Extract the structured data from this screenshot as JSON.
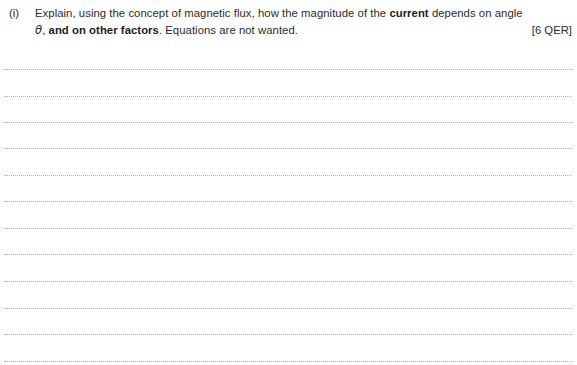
{
  "page": {
    "background_color": "#ffffff",
    "text_color": "#2b2b2b",
    "rule_color": "#a8a8ad",
    "width": 577,
    "height": 365
  },
  "question": {
    "label": "(i)",
    "line1_part1": "Explain, using the concept of magnetic flux, how the magnitude of the ",
    "line1_bold": "current",
    "line1_part2": " depends on angle",
    "line2_theta": "θ",
    "line2_part1": ", ",
    "line2_bold": "and on other factors",
    "line2_part2": ". Equations are not wanted.",
    "marks": "[6 QER]",
    "full_text": "(i) Explain, using the concept of magnetic flux, how the magnitude of the current depends on angle θ, and on other factors. Equations are not wanted. [6 QER]"
  },
  "answer_area": {
    "line_count": 12,
    "line_style": "dotted",
    "first_line_y": 69,
    "line_spacing": 26.5,
    "left_inset": 4,
    "right_inset": 5,
    "lines": [
      {
        "index": 1,
        "y": 69,
        "content": ""
      },
      {
        "index": 2,
        "y": 95.5,
        "content": ""
      },
      {
        "index": 3,
        "y": 122,
        "content": ""
      },
      {
        "index": 4,
        "y": 148,
        "content": ""
      },
      {
        "index": 5,
        "y": 174.5,
        "content": ""
      },
      {
        "index": 6,
        "y": 201,
        "content": ""
      },
      {
        "index": 7,
        "y": 227.5,
        "content": ""
      },
      {
        "index": 8,
        "y": 254,
        "content": ""
      },
      {
        "index": 9,
        "y": 281,
        "content": ""
      },
      {
        "index": 10,
        "y": 307.5,
        "content": ""
      },
      {
        "index": 11,
        "y": 334,
        "content": ""
      },
      {
        "index": 12,
        "y": 360.5,
        "content": ""
      }
    ]
  }
}
